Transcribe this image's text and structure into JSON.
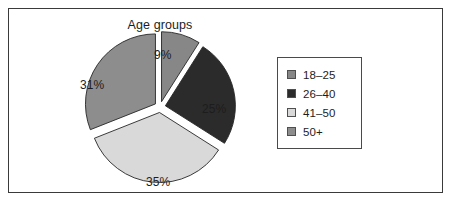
{
  "chart_data": {
    "type": "pie",
    "title": "Age groups",
    "categories": [
      "18–25",
      "26–40",
      "41–50",
      "50+"
    ],
    "values": [
      9,
      25,
      35,
      31
    ],
    "value_labels": [
      "9%",
      "25%",
      "35%",
      "31%"
    ],
    "units": "percent",
    "colors": [
      "#878787",
      "#2b2b2b",
      "#d9d9d9",
      "#8d8d8d"
    ],
    "exploded": true,
    "start_angle_deg": 0,
    "direction": "clockwise",
    "legend": {
      "position": "right",
      "bordered": true,
      "entries": [
        {
          "label": "18–25",
          "color": "#878787"
        },
        {
          "label": "26–40",
          "color": "#2b2b2b"
        },
        {
          "label": "41–50",
          "color": "#d9d9d9"
        },
        {
          "label": "50+",
          "color": "#8d8d8d"
        }
      ]
    },
    "grid": false,
    "xlabel": "",
    "ylabel": ""
  },
  "figure": {
    "frame_color": "#3a3a3a",
    "background": "#ffffff"
  }
}
